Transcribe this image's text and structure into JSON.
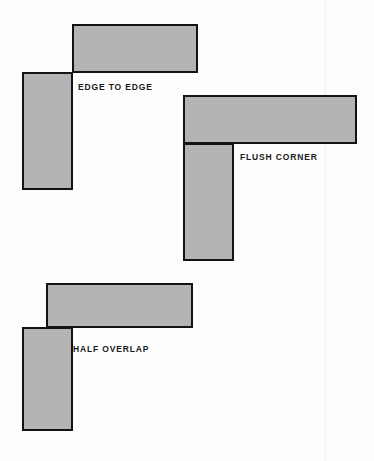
{
  "figure": {
    "background_color": "#fdfdfd",
    "fill_color": "#b4b4b4",
    "stroke_color": "#131313",
    "stroke_width_px": 2,
    "width_px": 374,
    "height_px": 461
  },
  "diagrams": [
    {
      "id": "edge-to-edge",
      "label": "EDGE TO EDGE",
      "label_x": 78,
      "label_y": 83,
      "description": "Horizontal bar butts against the top edge of the vertical bar with no overlap",
      "shapes": [
        {
          "name": "horizontal-bar",
          "x": 72,
          "y": 24,
          "w": 126,
          "h": 49,
          "z": 1
        },
        {
          "name": "vertical-bar",
          "x": 22,
          "y": 72,
          "w": 51,
          "h": 118,
          "z": 2
        }
      ]
    },
    {
      "id": "flush-corner",
      "label": "FLUSH CORNER",
      "label_x": 240,
      "label_y": 153,
      "description": "Horizontal bar and vertical bar share a flush left edge forming an L",
      "shapes": [
        {
          "name": "horizontal-bar",
          "x": 183,
          "y": 95,
          "w": 174,
          "h": 49,
          "z": 1
        },
        {
          "name": "vertical-bar",
          "x": 183,
          "y": 143,
          "w": 51,
          "h": 118,
          "z": 2
        }
      ]
    },
    {
      "id": "half-overlap",
      "label": "HALF OVERLAP",
      "label_x": 73,
      "label_y": 345,
      "description": "Horizontal bar left edge sits at the mid-width of the vertical bar, overlapping half of it",
      "shapes": [
        {
          "name": "horizontal-bar",
          "x": 46,
          "y": 283,
          "w": 147,
          "h": 45,
          "z": 1
        },
        {
          "name": "vertical-bar",
          "x": 22,
          "y": 327,
          "w": 51,
          "h": 104,
          "z": 2
        }
      ]
    }
  ],
  "artifacts": [
    {
      "name": "scan-streak",
      "x": 324
    }
  ]
}
